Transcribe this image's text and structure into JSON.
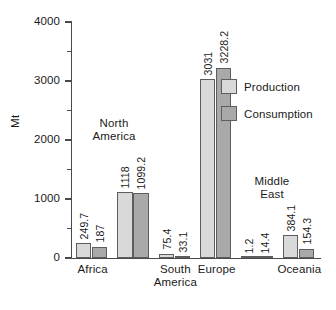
{
  "chart_data": {
    "type": "bar",
    "title": "",
    "xlabel": "",
    "ylabel": "Mt",
    "ylim": [
      0,
      4000
    ],
    "yticks": [
      0,
      1000,
      2000,
      3000,
      4000
    ],
    "ytick_labels": [
      "0",
      "1000",
      "2000",
      "3000",
      "4000"
    ],
    "minor_ticks": [
      500,
      1500,
      2500,
      3500
    ],
    "grid": false,
    "legend_position": "upper right",
    "categories": [
      "Africa",
      "North America",
      "South America",
      "Europe",
      "Middle East",
      "Oceania"
    ],
    "axis_tick_categories": [
      "Africa",
      "South\nAmerica",
      "Europe",
      "Oceania"
    ],
    "inplot_annotations": [
      {
        "label": "North\nAmerica",
        "category": "North America"
      },
      {
        "label": "Middle\nEast",
        "category": "Middle East"
      }
    ],
    "series": [
      {
        "name": "Production",
        "color": "#d9d9d9",
        "values": [
          249.7,
          1118,
          75.4,
          3031,
          1.2,
          384.1
        ],
        "value_labels": [
          "249.7",
          "1118",
          "75.4",
          "3031",
          "1.2",
          "384.1"
        ]
      },
      {
        "name": "Consumption",
        "color": "#a9a9a9",
        "values": [
          187,
          1099.2,
          33.1,
          3228.2,
          14.4,
          154.3
        ],
        "value_labels": [
          "187",
          "1099.2",
          "33.1",
          "3228.2",
          "14.4",
          "154.3"
        ]
      }
    ]
  },
  "legend": {
    "items": [
      {
        "label": "Production",
        "swatch": "production"
      },
      {
        "label": "Consumption",
        "swatch": "consumption"
      }
    ]
  },
  "caption_remnant": ""
}
